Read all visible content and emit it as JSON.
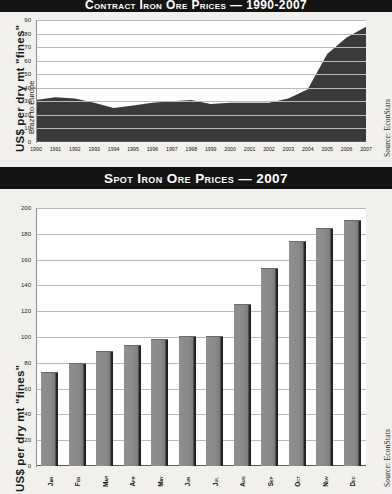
{
  "charts": {
    "top": {
      "title": "Contract Iron Ore Prices  —  1990-2007",
      "ylabel": "US$ per dry mt \"fines\"",
      "ysub": "Brazil to Europe",
      "source": "Source: EconStats"
    },
    "bottom": {
      "title": "Spot Iron Ore Prices — 2007",
      "ylabel": "US$ per dry mt \"fines\"",
      "source": "Source: EconStats"
    }
  },
  "chart_data": [
    {
      "type": "area",
      "title": "Contract Iron Ore Prices  —  1990-2007",
      "xlabel": "",
      "ylabel": "US$ per dry mt \"fines\"",
      "subtitle": "Brazil to Europe",
      "source": "Source: EconStats",
      "grid": true,
      "ylim": [
        0,
        90
      ],
      "yticks": [
        0,
        10,
        20,
        30,
        40,
        50,
        60,
        70,
        80,
        90
      ],
      "categories": [
        "1990",
        "1991",
        "1992",
        "1993",
        "1994",
        "1995",
        "1996",
        "1997",
        "1998",
        "1999",
        "2000",
        "2001",
        "2002",
        "2003",
        "2004",
        "2005",
        "2006",
        "2007"
      ],
      "values": [
        31,
        33,
        32,
        29,
        25,
        27,
        29,
        30,
        31,
        28,
        29,
        29,
        29,
        32,
        39,
        65,
        77,
        85
      ],
      "fill_color": "#3a3a3a"
    },
    {
      "type": "bar",
      "title": "Spot Iron Ore Prices — 2007",
      "xlabel": "",
      "ylabel": "US$ per dry mt \"fines\"",
      "source": "Source: EconStats",
      "grid": true,
      "ylim": [
        0,
        200
      ],
      "yticks": [
        0,
        20,
        40,
        60,
        80,
        100,
        120,
        140,
        160,
        180,
        200
      ],
      "categories": [
        "Jan",
        "Feb",
        "Mar",
        "Apr",
        "May",
        "Jun",
        "Jul",
        "Aug",
        "Sep",
        "Oct",
        "Nov",
        "Dec"
      ],
      "values": [
        72,
        79,
        88,
        93,
        98,
        100,
        100,
        125,
        153,
        174,
        184,
        190
      ],
      "bar_color": "#8a8a8a"
    }
  ]
}
